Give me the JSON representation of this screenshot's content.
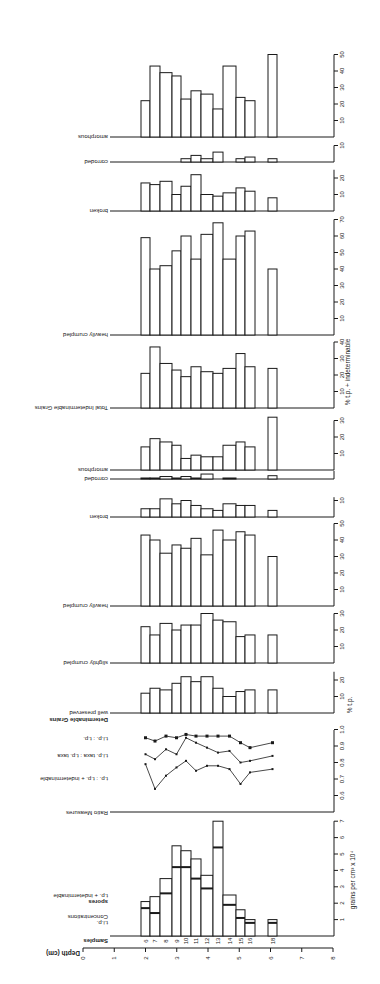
{
  "figure": {
    "orientation_note": "Figure rendered rotated 90 degrees; text reads upside-down along the left margin",
    "depth_axis": {
      "label": "Depth (cm)",
      "ticks": [
        0,
        1,
        2,
        3,
        4,
        5,
        6,
        7,
        8
      ]
    },
    "samples_label": "Samples",
    "samples": [
      "6",
      "7",
      "8",
      "9",
      "10",
      "11",
      "12",
      "13",
      "14",
      "15",
      "16",
      "18"
    ]
  },
  "chart_data": [
    {
      "type": "bar",
      "id": "concentrations",
      "title": "Concentrations",
      "legend": [
        "t.i.p.",
        "spores",
        "t.p. + indeterminable"
      ],
      "ylabel": "grains per cm3 x 10^4",
      "ylim": [
        0,
        7
      ],
      "yticks": [
        1,
        2,
        3,
        4,
        5,
        6,
        7
      ],
      "categories": [
        "6",
        "7",
        "8",
        "9",
        "10",
        "11",
        "12",
        "13",
        "14",
        "15",
        "16",
        "18"
      ],
      "depth_cm": [
        2.0,
        2.3,
        2.6,
        3.0,
        3.3,
        3.6,
        4.0,
        4.4,
        4.8,
        5.1,
        5.5,
        6.2
      ],
      "series": [
        {
          "name": "t.p. + indeterminable (total)",
          "values": [
            2.1,
            2.4,
            3.5,
            5.5,
            5.2,
            4.7,
            3.7,
            7.0,
            2.5,
            1.6,
            1.0,
            1.0
          ]
        },
        {
          "name": "t.i.p. (lower segment)",
          "values": [
            1.7,
            1.4,
            2.6,
            4.2,
            4.2,
            3.5,
            2.9,
            5.4,
            1.9,
            1.1,
            0.8,
            0.8
          ]
        }
      ]
    },
    {
      "type": "line",
      "id": "ratio_measures",
      "title": "Ratio Measures",
      "ylim": [
        0.5,
        1.0
      ],
      "yticks": [
        0.6,
        0.7,
        0.8,
        0.9,
        1.0
      ],
      "categories": [
        "6",
        "7",
        "8",
        "9",
        "10",
        "11",
        "12",
        "13",
        "14",
        "15",
        "16",
        "18"
      ],
      "series": [
        {
          "name": "t.i.p. : t.p.",
          "values": [
            0.95,
            0.93,
            0.96,
            0.95,
            0.97,
            0.96,
            0.96,
            0.96,
            0.96,
            0.92,
            0.89,
            0.92
          ]
        },
        {
          "name": "t.i.p. taxa : t.p. taxa",
          "values": [
            0.85,
            0.82,
            0.88,
            0.85,
            0.95,
            0.92,
            0.89,
            0.86,
            0.87,
            0.8,
            0.81,
            0.84
          ]
        },
        {
          "name": "t.p. : t.p. + indeterminable",
          "values": [
            0.79,
            0.64,
            0.72,
            0.77,
            0.81,
            0.75,
            0.78,
            0.78,
            0.76,
            0.67,
            0.74,
            0.76
          ]
        }
      ]
    },
    {
      "type": "bar",
      "id": "det_well_preserved",
      "group": "Determinable Grains",
      "title": "well preserved",
      "ylabel": "% t.p.",
      "yticks": [
        10,
        20
      ],
      "ylim": [
        0,
        25
      ],
      "values": [
        12,
        15,
        14,
        18,
        22,
        19,
        22,
        15,
        10,
        13,
        14,
        14
      ]
    },
    {
      "type": "bar",
      "id": "det_slightly_crumpled",
      "title": "slightly crumpled",
      "yticks": [
        10,
        20,
        30
      ],
      "ylim": [
        0,
        30
      ],
      "values": [
        22,
        17,
        24,
        20,
        23,
        23,
        30,
        26,
        25,
        16,
        17,
        17
      ]
    },
    {
      "type": "bar",
      "id": "det_heavily_crumpled",
      "title": "heavily crumpled",
      "yticks": [
        10,
        20,
        30,
        40,
        50
      ],
      "ylim": [
        0,
        50
      ],
      "values": [
        43,
        40,
        32,
        37,
        35,
        41,
        31,
        46,
        40,
        45,
        43,
        30
      ]
    },
    {
      "type": "bar",
      "id": "det_broken",
      "title": "broken",
      "yticks": [
        10
      ],
      "ylim": [
        0,
        12
      ],
      "values": [
        5,
        5,
        11,
        8,
        10,
        7,
        5,
        4,
        8,
        7,
        7,
        4
      ]
    },
    {
      "type": "bar",
      "id": "det_corroded",
      "title": "corroded",
      "yticks": [],
      "ylim": [
        0,
        5
      ],
      "values": [
        0.5,
        0.5,
        1.5,
        0.5,
        1.5,
        0.5,
        3,
        0,
        0.5,
        0,
        0,
        2
      ]
    },
    {
      "type": "bar",
      "id": "det_amorphous",
      "title": "amorphous",
      "yticks": [
        10,
        20,
        30
      ],
      "ylim": [
        0,
        30
      ],
      "values": [
        14,
        19,
        17,
        15,
        7,
        9,
        8,
        8,
        15,
        17,
        14,
        32
      ]
    },
    {
      "type": "bar",
      "id": "total_indeterminable",
      "title": "Total Indeterminable Grains",
      "ylabel": "% t.p. + indeterminable",
      "yticks": [
        10,
        20,
        30,
        40
      ],
      "ylim": [
        0,
        40
      ],
      "values": [
        21,
        37,
        27,
        23,
        19,
        25,
        22,
        21,
        24,
        33,
        25,
        24
      ]
    },
    {
      "type": "bar",
      "id": "ind_heavily_crumpled",
      "title": "heavily crumpled",
      "yticks": [
        10,
        20,
        30,
        40,
        50,
        60,
        70
      ],
      "ylim": [
        0,
        70
      ],
      "values": [
        59,
        40,
        42,
        51,
        60,
        46,
        61,
        68,
        46,
        60,
        63,
        40
      ]
    },
    {
      "type": "bar",
      "id": "ind_broken",
      "title": "broken",
      "yticks": [
        10,
        20
      ],
      "ylim": [
        0,
        25
      ],
      "values": [
        17,
        16,
        18,
        10,
        15,
        22,
        10,
        9,
        11,
        14,
        12,
        8
      ]
    },
    {
      "type": "bar",
      "id": "ind_corroded",
      "title": "corroded",
      "yticks": [
        10
      ],
      "ylim": [
        0,
        10
      ],
      "values": [
        0,
        0,
        0,
        0,
        2,
        4,
        2,
        6,
        0,
        2,
        3,
        2
      ]
    },
    {
      "type": "bar",
      "id": "ind_amorphous",
      "title": "amorphous",
      "yticks": [
        10,
        20,
        30,
        40,
        50
      ],
      "ylim": [
        0,
        50
      ],
      "values": [
        22,
        43,
        39,
        37,
        23,
        28,
        26,
        17,
        43,
        24,
        22,
        50
      ]
    }
  ],
  "colors": {
    "ink": "#1a1a1a",
    "paper": "#ffffff"
  }
}
